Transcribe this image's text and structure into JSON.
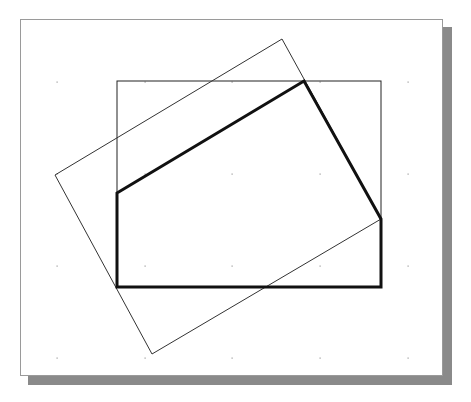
{
  "diagram": {
    "frame": {
      "x": 20,
      "y": 19,
      "width": 423,
      "height": 357,
      "border_color": "#9a9a9a",
      "shadow_color": "#8a8a8a"
    },
    "grid_dots": {
      "xs": [
        57,
        145,
        232,
        320,
        408
      ],
      "ys": [
        82,
        174,
        266,
        358
      ],
      "color": "#9a9a9a"
    },
    "clip_window": {
      "x": 117,
      "y": 81,
      "width": 264,
      "height": 206,
      "stroke": "#222222",
      "stroke_width": 1
    },
    "rotated_rectangle": {
      "points": [
        [
          282,
          39
        ],
        [
          381,
          219
        ],
        [
          152,
          354
        ],
        [
          55,
          175
        ]
      ],
      "stroke": "#333333",
      "stroke_width": 1
    },
    "clipped_polygon": {
      "points": [
        [
          117,
          193
        ],
        [
          304,
          81
        ],
        [
          381,
          219
        ],
        [
          381,
          287
        ],
        [
          117,
          287
        ]
      ],
      "stroke": "#111111",
      "stroke_width": 3
    }
  }
}
